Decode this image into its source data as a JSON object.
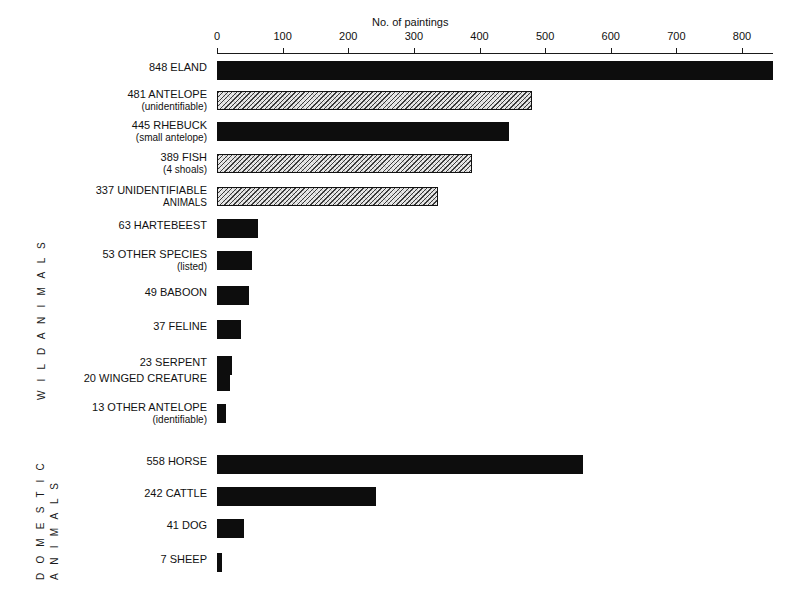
{
  "axis": {
    "title": "No. of paintings",
    "ticks": [
      0,
      100,
      200,
      300,
      400,
      500,
      600,
      700,
      800
    ],
    "min": 0,
    "max": 800
  },
  "groups": [
    {
      "id": "wild",
      "label": "W I L D   A N I M A L S"
    },
    {
      "id": "domestic",
      "label_line1": "D O M E S T I C",
      "label_line2": "A N I M A L S"
    }
  ],
  "chart_data": {
    "type": "bar",
    "orientation": "horizontal",
    "title": "",
    "xlabel": "No. of paintings",
    "ylabel": "",
    "xlim": [
      0,
      800
    ],
    "grid": false,
    "legend": "none",
    "groups": [
      "WILD ANIMALS",
      "DOMESTIC ANIMALS"
    ],
    "categories": [
      "ELAND",
      "ANTELOPE (unidentifiable)",
      "RHEBUCK (small antelope)",
      "FISH (4 shoals)",
      "UNIDENTIFIABLE ANIMALS",
      "HARTEBEEST",
      "OTHER SPECIES (listed)",
      "BABOON",
      "FELINE",
      "SERPENT",
      "WINGED CREATURE",
      "OTHER ANTELOPE (identifiable)",
      "HORSE",
      "CATTLE",
      "DOG",
      "SHEEP"
    ],
    "values": [
      848,
      481,
      445,
      389,
      337,
      63,
      53,
      49,
      37,
      23,
      20,
      13,
      558,
      242,
      41,
      7
    ]
  },
  "rows": [
    {
      "group": "wild",
      "value": 848,
      "count": "848",
      "name": "ELAND",
      "sub": "",
      "fill": "solid",
      "top": 61
    },
    {
      "group": "wild",
      "value": 481,
      "count": "481",
      "name": "ANTELOPE",
      "sub": "(unidentifiable)",
      "fill": "hatch",
      "top": 91
    },
    {
      "group": "wild",
      "value": 445,
      "count": "445",
      "name": "RHEBUCK",
      "sub": "(small antelope)",
      "fill": "solid",
      "top": 122
    },
    {
      "group": "wild",
      "value": 389,
      "count": "389",
      "name": "FISH",
      "sub": "(4 shoals)",
      "fill": "hatch",
      "top": 154
    },
    {
      "group": "wild",
      "value": 337,
      "count": "337",
      "name": "UNIDENTIFIABLE",
      "sub": "ANIMALS",
      "fill": "hatch",
      "top": 187
    },
    {
      "group": "wild",
      "value": 63,
      "count": "63",
      "name": "HARTEBEEST",
      "sub": "",
      "fill": "solid",
      "top": 219
    },
    {
      "group": "wild",
      "value": 53,
      "count": "53",
      "name": "OTHER SPECIES",
      "sub": "(listed)",
      "fill": "solid",
      "top": 251
    },
    {
      "group": "wild",
      "value": 49,
      "count": "49",
      "name": "BABOON",
      "sub": "",
      "fill": "solid",
      "top": 286
    },
    {
      "group": "wild",
      "value": 37,
      "count": "37",
      "name": "FELINE",
      "sub": "",
      "fill": "solid",
      "top": 320
    },
    {
      "group": "wild",
      "value": 23,
      "count": "23",
      "name": "SERPENT",
      "sub": "",
      "fill": "solid",
      "top": 356
    },
    {
      "group": "wild",
      "value": 20,
      "count": "20",
      "name": "WINGED CREATURE",
      "sub": "",
      "fill": "solid",
      "top": 372
    },
    {
      "group": "wild",
      "value": 13,
      "count": "13",
      "name": "OTHER ANTELOPE",
      "sub": "(identifiable)",
      "fill": "solid",
      "top": 404
    },
    {
      "group": "domestic",
      "value": 558,
      "count": "558",
      "name": "HORSE",
      "sub": "",
      "fill": "solid",
      "top": 455
    },
    {
      "group": "domestic",
      "value": 242,
      "count": "242",
      "name": "CATTLE",
      "sub": "",
      "fill": "solid",
      "top": 487
    },
    {
      "group": "domestic",
      "value": 41,
      "count": "41",
      "name": "DOG",
      "sub": "",
      "fill": "solid",
      "top": 519
    },
    {
      "group": "domestic",
      "value": 7,
      "count": "7",
      "name": "SHEEP",
      "sub": "",
      "fill": "solid",
      "top": 553
    }
  ]
}
